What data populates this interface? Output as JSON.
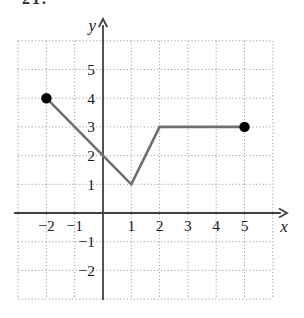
{
  "figure": {
    "problem_number_fragment": "21.",
    "background": "#ffffff"
  },
  "chart_data": {
    "type": "line",
    "title": "",
    "xlabel": "x",
    "ylabel": "y",
    "xlim": [
      -3,
      6
    ],
    "ylim": [
      -3,
      6
    ],
    "x_ticks": [
      -2,
      -1,
      1,
      2,
      3,
      4,
      5
    ],
    "y_ticks": [
      5,
      4,
      3,
      2,
      1,
      -1,
      -2
    ],
    "grid": "dotted",
    "legend": "none",
    "series": [
      {
        "name": "piecewise-linear-function",
        "points": [
          [
            -2,
            4
          ],
          [
            1,
            1
          ],
          [
            2,
            3
          ],
          [
            5,
            3
          ]
        ],
        "segments": [
          "(-2,4) to (1,1)",
          "(1,1) to (2,3)",
          "(2,3) to (5,3)"
        ],
        "endpoint_dots": [
          [
            -2,
            4
          ],
          [
            5,
            3
          ]
        ],
        "color": "#6f6f6f",
        "dot_color": "#000000"
      }
    ],
    "colors": {
      "axis": "#404040",
      "grid": "#8f8f8f",
      "label": "#1b1b1b",
      "curve": "#6f6f6f",
      "dot": "#000000"
    }
  }
}
